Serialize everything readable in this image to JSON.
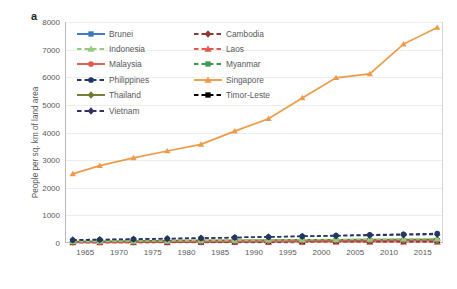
{
  "panel_label": "a",
  "axes": {
    "ylabel": "People per sq. km of land area",
    "xlabel": "",
    "yticks": [
      "0",
      "1000",
      "2000",
      "3000",
      "4000",
      "5000",
      "6000",
      "7000",
      "8000"
    ],
    "xticks": [
      "1965",
      "1970",
      "1975",
      "1980",
      "1985",
      "1990",
      "1995",
      "2000",
      "2005",
      "2010",
      "2015"
    ]
  },
  "legend": {
    "entries": [
      {
        "label": "Brunei",
        "color": "#3a78bd",
        "dash": "solid",
        "marker": "square"
      },
      {
        "label": "Cambodia",
        "color": "#8c3a36",
        "dash": "dashed",
        "marker": "diamond"
      },
      {
        "label": "Indonesia",
        "color": "#96c97d",
        "dash": "dashed",
        "marker": "triangle"
      },
      {
        "label": "Laos",
        "color": "#e2584d",
        "dash": "dashed",
        "marker": "triangle"
      },
      {
        "label": "Malaysia",
        "color": "#e2584d",
        "dash": "solid",
        "marker": "circle"
      },
      {
        "label": "Myanmar",
        "color": "#3e9c52",
        "dash": "dashed",
        "marker": "square"
      },
      {
        "label": "Philippines",
        "color": "#1f3864",
        "dash": "dashed",
        "marker": "circle"
      },
      {
        "label": "Singapore",
        "color": "#ed9b49",
        "dash": "solid",
        "marker": "triangle"
      },
      {
        "label": "Thailand",
        "color": "#6f7a2e",
        "dash": "solid",
        "marker": "diamond"
      },
      {
        "label": "Timor-Leste",
        "color": "#000000",
        "dash": "dashed",
        "marker": "square"
      },
      {
        "label": "Vietnam",
        "color": "#3b2f63",
        "dash": "dashed",
        "marker": "diamond"
      }
    ]
  },
  "chart_data": {
    "type": "line",
    "title": "",
    "xlabel": "",
    "ylabel": "People per sq. km of land area",
    "xlim": [
      1962,
      2018
    ],
    "ylim": [
      0,
      8000
    ],
    "grid": true,
    "legend_position": "top-left-inside",
    "x": [
      1963,
      1967,
      1972,
      1977,
      1982,
      1987,
      1992,
      1997,
      2002,
      2007,
      2012,
      2017
    ],
    "series": [
      {
        "name": "Brunei",
        "values": [
          18,
          21,
          25,
          31,
          38,
          45,
          52,
          60,
          66,
          72,
          77,
          82
        ]
      },
      {
        "name": "Cambodia",
        "values": [
          34,
          40,
          43,
          36,
          40,
          48,
          57,
          66,
          75,
          82,
          88,
          94
        ]
      },
      {
        "name": "Indonesia",
        "values": [
          55,
          61,
          69,
          78,
          88,
          98,
          108,
          118,
          127,
          136,
          144,
          152
        ]
      },
      {
        "name": "Laos",
        "values": [
          10,
          11,
          13,
          14,
          16,
          18,
          20,
          23,
          25,
          27,
          29,
          31
        ]
      },
      {
        "name": "Malaysia",
        "values": [
          27,
          31,
          36,
          41,
          46,
          52,
          60,
          68,
          76,
          83,
          90,
          96
        ]
      },
      {
        "name": "Myanmar",
        "values": [
          34,
          38,
          43,
          48,
          54,
          60,
          65,
          70,
          74,
          77,
          80,
          82
        ]
      },
      {
        "name": "Philippines",
        "values": [
          101,
          116,
          135,
          155,
          176,
          198,
          221,
          246,
          272,
          297,
          321,
          345
        ]
      },
      {
        "name": "Singapore",
        "values": [
          2500,
          2800,
          3080,
          3330,
          3570,
          4050,
          4500,
          5250,
          5980,
          6120,
          7200,
          7800
        ]
      },
      {
        "name": "Thailand",
        "values": [
          58,
          66,
          76,
          86,
          96,
          104,
          111,
          117,
          122,
          126,
          130,
          135
        ]
      },
      {
        "name": "Timor-Leste",
        "values": [
          38,
          41,
          44,
          42,
          45,
          50,
          55,
          60,
          66,
          73,
          80,
          87
        ]
      },
      {
        "name": "Vietnam",
        "values": [
          114,
          127,
          143,
          161,
          179,
          199,
          220,
          240,
          258,
          275,
          292,
          310
        ]
      }
    ]
  }
}
